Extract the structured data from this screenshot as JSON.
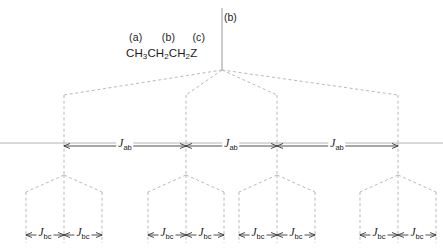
{
  "diagram": {
    "title_labels": {
      "proton_a": "(a)",
      "proton_b": "(b)",
      "proton_c": "(c)",
      "formula_part1": "CH",
      "formula_sub1": "3",
      "formula_part2": "CH",
      "formula_sub2": "2",
      "formula_part3": "CH",
      "formula_sub3": "2",
      "formula_part4": "Z",
      "formula_full": "CH3CH2CH2Z"
    },
    "root_label": "(b)",
    "coupling_ab": {
      "symbol": "J",
      "subscript": "ab",
      "full": "Jab",
      "count": 3
    },
    "coupling_bc": {
      "symbol": "J",
      "subscript": "bc",
      "full": "Jbc",
      "count": 8
    },
    "colors": {
      "dashed_line": "#b9b9b9",
      "solid_line": "#9a9a9a",
      "baseline": "#aaaaaa",
      "arrow": "#3a3a3a",
      "text": "#1b1b1b",
      "background": "#ffffff"
    },
    "structure": {
      "apex_x": 222,
      "apex_y": 70,
      "baseline_y": 143,
      "quartet_x": [
        64,
        186,
        277,
        398
      ],
      "quartet_branch_y": 95,
      "triplet_y": 175,
      "bottom_y": 240,
      "triplet_groups": [
        {
          "center": 64,
          "lines": [
            26,
            64,
            102
          ]
        },
        {
          "center": 186,
          "lines": [
            148,
            186,
            224
          ]
        },
        {
          "center": 277,
          "lines": [
            239,
            277,
            315
          ]
        },
        {
          "center": 398,
          "lines": [
            360,
            398,
            436
          ]
        }
      ]
    },
    "jab_arrows": [
      {
        "x1": 64,
        "x2": 186,
        "mid": 125
      },
      {
        "x1": 186,
        "x2": 277,
        "mid": 231
      },
      {
        "x1": 277,
        "x2": 398,
        "mid": 337
      }
    ],
    "jbc_arrows": [
      {
        "x1": 26,
        "x2": 64,
        "mid": 45
      },
      {
        "x1": 64,
        "x2": 102,
        "mid": 83
      },
      {
        "x1": 148,
        "x2": 186,
        "mid": 167
      },
      {
        "x1": 186,
        "x2": 224,
        "mid": 205
      },
      {
        "x1": 239,
        "x2": 277,
        "mid": 258
      },
      {
        "x1": 277,
        "x2": 315,
        "mid": 296
      },
      {
        "x1": 360,
        "x2": 398,
        "mid": 379
      },
      {
        "x1": 398,
        "x2": 436,
        "mid": 417
      }
    ]
  }
}
